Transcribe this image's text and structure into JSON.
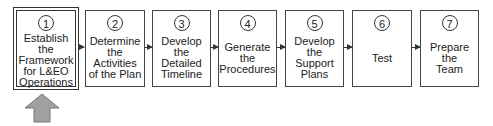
{
  "diagram": {
    "type": "process-flow",
    "steps": [
      {
        "number": "1",
        "label": "Establish\nthe\nFramework\nfor L&EO\nOperations",
        "highlighted": true
      },
      {
        "number": "2",
        "label": "Determine\nthe\nActivities\nof the Plan",
        "highlighted": false
      },
      {
        "number": "3",
        "label": "Develop\nthe\nDetailed\nTimeline",
        "highlighted": false
      },
      {
        "number": "4",
        "label": "Generate\nthe\nProcedures",
        "highlighted": false
      },
      {
        "number": "5",
        "label": "Develop\nthe\nSupport\nPlans",
        "highlighted": false
      },
      {
        "number": "6",
        "label": "Test",
        "highlighted": false
      },
      {
        "number": "7",
        "label": "Prepare\nthe\nTeam",
        "highlighted": false
      }
    ],
    "current_step_indicator": {
      "target_step": "1",
      "icon": "up-arrow-icon",
      "color": "#a0a0a0"
    }
  }
}
